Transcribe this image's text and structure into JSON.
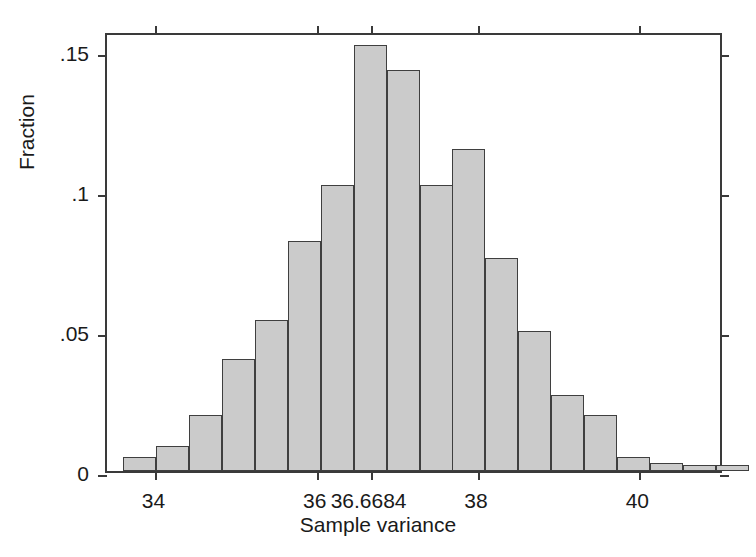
{
  "figure": {
    "width": 756,
    "height": 557,
    "background": "#ffffff",
    "bar_fill": "#cbcbcb",
    "bar_stroke": "#3f3f3f",
    "axis_color": "#3a3a3a"
  },
  "chart_data": {
    "type": "bar",
    "title": "",
    "subtitle": "",
    "xlabel": "Sample variance",
    "ylabel": "Fraction",
    "xlim": [
      33.4,
      41.05
    ],
    "ylim": [
      0,
      0.157
    ],
    "grid": false,
    "legend": null,
    "legend_position": "none",
    "xtick_values": [
      34,
      36,
      36.6684,
      38,
      40
    ],
    "xtick_labels": [
      "34",
      "36",
      "36.6684",
      "38",
      "40"
    ],
    "ytick_values": [
      0,
      0.05,
      0.1,
      0.15
    ],
    "ytick_labels": [
      "0",
      ".05",
      ".1",
      ".15"
    ],
    "bin_width": 0.408,
    "bin_left_edges": [
      33.6,
      34.01,
      34.42,
      34.83,
      35.23,
      35.64,
      36.05,
      36.46,
      36.87,
      37.28,
      37.68,
      38.09,
      38.5,
      38.91,
      39.32,
      39.72,
      40.13,
      40.54,
      40.95
    ],
    "bin_centers": [
      33.8,
      34.21,
      34.62,
      35.03,
      35.44,
      35.84,
      36.25,
      36.66,
      37.07,
      37.48,
      37.89,
      38.29,
      38.7,
      39.11,
      39.52,
      39.93,
      40.33,
      40.74,
      41.15
    ],
    "categories": [
      "33.80",
      "34.21",
      "34.62",
      "35.03",
      "35.44",
      "35.84",
      "36.25",
      "36.66",
      "37.07",
      "37.48",
      "37.89",
      "38.29",
      "38.70",
      "39.11",
      "39.52",
      "39.93",
      "40.33",
      "40.74",
      "41.15"
    ],
    "values": [
      0.005,
      0.009,
      0.02,
      0.04,
      0.054,
      0.082,
      0.102,
      0.152,
      0.143,
      0.102,
      0.115,
      0.076,
      0.05,
      0.027,
      0.02,
      0.005,
      0.003,
      0.002,
      0.002
    ],
    "annotations": []
  }
}
